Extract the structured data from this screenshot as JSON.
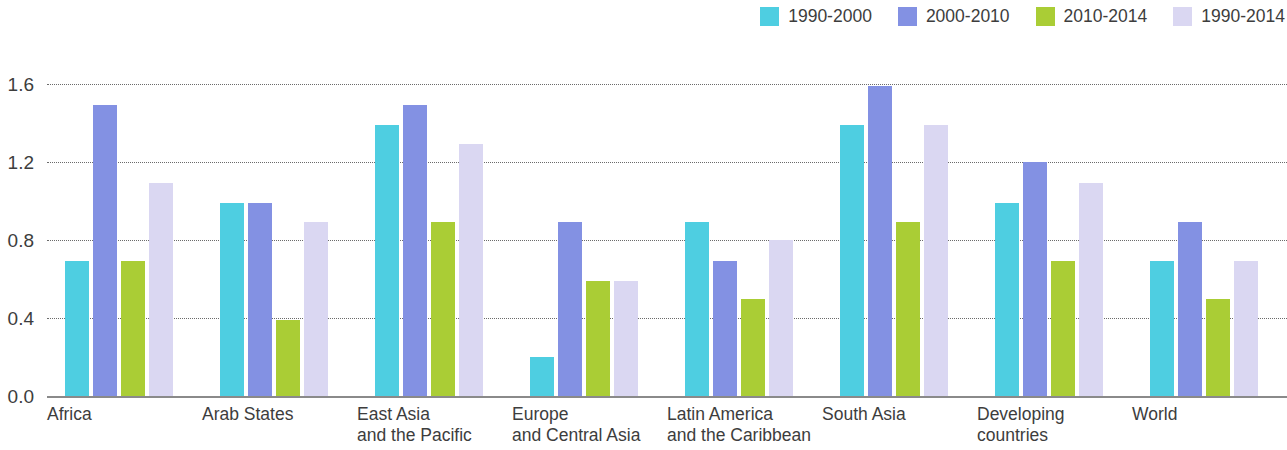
{
  "chart_data": {
    "type": "bar",
    "title": "",
    "subtitle": "",
    "xlabel": "",
    "ylabel": "",
    "ylim": [
      0.0,
      1.6
    ],
    "yticks": [
      "0.0",
      "0.4",
      "0.8",
      "1.2",
      "1.6"
    ],
    "ytick_values": [
      0.0,
      0.4,
      0.8,
      1.2,
      1.6
    ],
    "grid": true,
    "legend_position": "top-right",
    "categories": [
      "Africa",
      "Arab States",
      "East Asia and the Pacific",
      "Europe and Central Asia",
      "Latin America and the Caribbean",
      "South Asia",
      "Developing countries",
      "World"
    ],
    "category_lines": [
      [
        "Africa"
      ],
      [
        "Arab States"
      ],
      [
        "East Asia",
        "and the Pacific"
      ],
      [
        "Europe",
        "and Central Asia"
      ],
      [
        "Latin America",
        "and the Caribbean"
      ],
      [
        "South Asia"
      ],
      [
        "Developing countries"
      ],
      [
        "World"
      ]
    ],
    "series": [
      {
        "name": "1990-2000",
        "color": "#4ECEE1",
        "values": [
          0.69,
          0.99,
          1.39,
          0.2,
          0.89,
          1.39,
          0.99,
          0.69
        ]
      },
      {
        "name": "2000-2010",
        "color": "#8391E3",
        "values": [
          1.49,
          0.99,
          1.49,
          0.89,
          0.69,
          1.59,
          1.2,
          0.89
        ]
      },
      {
        "name": "2010-2014",
        "color": "#AACD35",
        "values": [
          0.69,
          0.39,
          0.89,
          0.59,
          0.5,
          0.89,
          0.69,
          0.5
        ]
      },
      {
        "name": "1990-2014",
        "color": "#DAD7F2",
        "values": [
          1.09,
          0.89,
          1.29,
          0.59,
          0.8,
          1.39,
          1.09,
          0.69
        ]
      }
    ]
  }
}
